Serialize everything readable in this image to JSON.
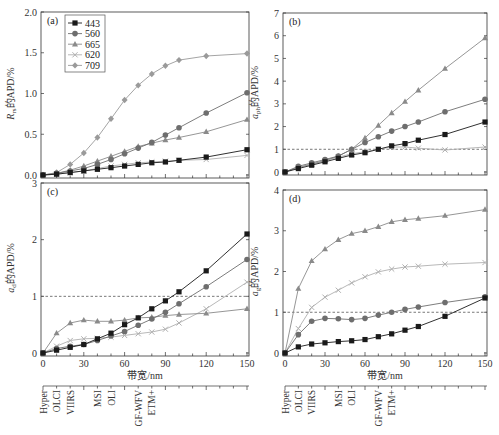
{
  "chart_data": [
    {
      "type": "line",
      "panel": "(a)",
      "ylabel": "Rrs的APD/%",
      "ylabel_main": "R",
      "ylabel_sub": "rs",
      "ylabel_rest": "的APD/%",
      "xlabel": "",
      "ylim": [
        0,
        2.0
      ],
      "yticks": [
        "0.0",
        "0.5",
        "1.0",
        "1.5",
        "2.0"
      ],
      "x": [
        0,
        10,
        20,
        30,
        40,
        50,
        60,
        70,
        80,
        90,
        100,
        120,
        150
      ],
      "legend": [
        "443",
        "560",
        "665",
        "620",
        "709"
      ],
      "series": [
        {
          "name": "443",
          "values": [
            0,
            0.01,
            0.03,
            0.05,
            0.07,
            0.09,
            0.11,
            0.13,
            0.15,
            0.16,
            0.18,
            0.22,
            0.31
          ]
        },
        {
          "name": "560",
          "values": [
            0,
            0.02,
            0.05,
            0.08,
            0.13,
            0.19,
            0.26,
            0.33,
            0.4,
            0.49,
            0.58,
            0.76,
            1.01
          ]
        },
        {
          "name": "665",
          "values": [
            0,
            0.02,
            0.06,
            0.11,
            0.17,
            0.23,
            0.29,
            0.35,
            0.39,
            0.43,
            0.46,
            0.53,
            0.68
          ]
        },
        {
          "name": "620",
          "values": [
            0,
            0.01,
            0.03,
            0.05,
            0.08,
            0.11,
            0.13,
            0.15,
            0.16,
            0.17,
            0.18,
            0.19,
            0.24
          ]
        },
        {
          "name": "709",
          "values": [
            0,
            0.03,
            0.13,
            0.27,
            0.46,
            0.69,
            0.92,
            1.1,
            1.24,
            1.34,
            1.41,
            1.46,
            1.49
          ]
        }
      ]
    },
    {
      "type": "line",
      "panel": "(b)",
      "ylabel": "aph的APD/%",
      "ylabel_main": "a",
      "ylabel_sub": "ph",
      "ylabel_rest": "的APD/%",
      "ylim": [
        0,
        7
      ],
      "yticks": [
        "0",
        "1",
        "2",
        "3",
        "4",
        "5",
        "6",
        "7"
      ],
      "reference_line": 1,
      "x": [
        0,
        10,
        20,
        30,
        40,
        50,
        60,
        70,
        80,
        90,
        100,
        120,
        150
      ],
      "series": [
        {
          "name": "443",
          "values": [
            0,
            0.15,
            0.3,
            0.45,
            0.6,
            0.75,
            0.85,
            1.0,
            1.15,
            1.25,
            1.4,
            1.65,
            2.2
          ]
        },
        {
          "name": "560",
          "values": [
            0,
            0.25,
            0.4,
            0.55,
            0.7,
            1.0,
            1.3,
            1.55,
            1.8,
            2.0,
            2.2,
            2.65,
            3.2
          ]
        },
        {
          "name": "665",
          "values": [
            0,
            0.2,
            0.35,
            0.5,
            0.7,
            1.0,
            1.5,
            2.05,
            2.6,
            3.1,
            3.6,
            4.55,
            5.9
          ]
        },
        {
          "name": "620",
          "values": [
            0,
            0.2,
            0.35,
            0.5,
            0.65,
            0.8,
            0.9,
            1.0,
            1.1,
            1.1,
            1.05,
            0.97,
            1.1
          ]
        }
      ]
    },
    {
      "type": "line",
      "panel": "(c)",
      "ylabel": "ad的APD/%",
      "ylabel_main": "a",
      "ylabel_sub": "d",
      "ylabel_rest": "的APD/%",
      "xlabel": "带宽/nm",
      "ylim": [
        0,
        3
      ],
      "yticks": [
        "0",
        "1",
        "2",
        "3"
      ],
      "xticks": [
        "0",
        "30",
        "60",
        "90",
        "120",
        "150"
      ],
      "reference_line": 1,
      "x": [
        0,
        10,
        20,
        30,
        40,
        50,
        60,
        70,
        80,
        90,
        100,
        120,
        150
      ],
      "series": [
        {
          "name": "443",
          "values": [
            0,
            0.05,
            0.1,
            0.15,
            0.25,
            0.35,
            0.5,
            0.62,
            0.78,
            0.92,
            1.08,
            1.45,
            2.1
          ]
        },
        {
          "name": "560",
          "values": [
            0,
            0.08,
            0.12,
            0.15,
            0.22,
            0.3,
            0.38,
            0.49,
            0.6,
            0.72,
            0.87,
            1.17,
            1.65
          ]
        },
        {
          "name": "665",
          "values": [
            0,
            0.35,
            0.53,
            0.58,
            0.56,
            0.56,
            0.58,
            0.62,
            0.63,
            0.66,
            0.68,
            0.7,
            0.78
          ]
        },
        {
          "name": "620",
          "values": [
            0,
            0.12,
            0.22,
            0.25,
            0.26,
            0.28,
            0.31,
            0.34,
            0.37,
            0.42,
            0.53,
            0.78,
            1.25
          ]
        }
      ]
    },
    {
      "type": "line",
      "panel": "(d)",
      "ylabel": "ag的APD/%",
      "ylabel_main": "a",
      "ylabel_sub": "g",
      "ylabel_rest": "的APD/%",
      "xlabel": "带宽/nm",
      "ylim": [
        0,
        4
      ],
      "yticks": [
        "0",
        "1",
        "2",
        "3",
        "4"
      ],
      "xticks": [
        "0",
        "30",
        "60",
        "90",
        "120",
        "150"
      ],
      "reference_line": 1,
      "x": [
        0,
        10,
        20,
        30,
        40,
        50,
        60,
        70,
        80,
        90,
        100,
        120,
        150
      ],
      "series": [
        {
          "name": "443",
          "values": [
            0,
            0.15,
            0.22,
            0.25,
            0.28,
            0.3,
            0.33,
            0.4,
            0.47,
            0.56,
            0.65,
            0.9,
            1.35
          ]
        },
        {
          "name": "560",
          "values": [
            0,
            0.45,
            0.78,
            0.85,
            0.84,
            0.82,
            0.85,
            0.93,
            1.0,
            1.07,
            1.13,
            1.24,
            1.38
          ]
        },
        {
          "name": "665",
          "values": [
            0,
            1.58,
            2.26,
            2.55,
            2.78,
            2.93,
            3.0,
            3.1,
            3.22,
            3.27,
            3.3,
            3.37,
            3.52
          ]
        },
        {
          "name": "620",
          "values": [
            0,
            0.6,
            1.12,
            1.37,
            1.54,
            1.72,
            1.87,
            1.99,
            2.06,
            2.11,
            2.13,
            2.18,
            2.22
          ]
        }
      ]
    }
  ],
  "sensors": [
    {
      "name": "Hyper",
      "bandwidth": 0
    },
    {
      "name": "OLCI",
      "bandwidth": 10
    },
    {
      "name": "VIIRS",
      "bandwidth": 20
    },
    {
      "name": "MSI",
      "bandwidth": 40
    },
    {
      "name": "OLI",
      "bandwidth": 50
    },
    {
      "name": "GF-WFV",
      "bandwidth": 70
    },
    {
      "name": "ETM+",
      "bandwidth": 80
    }
  ],
  "colors": {
    "443": "#1a1a1a",
    "560": "#6e6e6e",
    "665": "#8a8a8a",
    "620": "#b0b0b0",
    "709": "#9a9a9a",
    "axis": "#333333"
  }
}
